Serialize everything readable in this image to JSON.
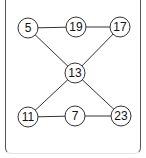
{
  "diagram": {
    "type": "graph",
    "nodes": [
      {
        "id": "n5",
        "label": "5",
        "x": 28,
        "y": 28
      },
      {
        "id": "n19",
        "label": "19",
        "x": 76,
        "y": 27
      },
      {
        "id": "n17",
        "label": "17",
        "x": 120,
        "y": 27
      },
      {
        "id": "n13",
        "label": "13",
        "x": 75,
        "y": 73
      },
      {
        "id": "n11",
        "label": "11",
        "x": 28,
        "y": 117
      },
      {
        "id": "n7",
        "label": "7",
        "x": 75,
        "y": 116
      },
      {
        "id": "n23",
        "label": "23",
        "x": 121,
        "y": 116
      }
    ],
    "edges": [
      [
        "n5",
        "n19"
      ],
      [
        "n19",
        "n17"
      ],
      [
        "n5",
        "n13"
      ],
      [
        "n17",
        "n13"
      ],
      [
        "n13",
        "n11"
      ],
      [
        "n13",
        "n23"
      ],
      [
        "n11",
        "n7"
      ],
      [
        "n7",
        "n23"
      ]
    ]
  }
}
